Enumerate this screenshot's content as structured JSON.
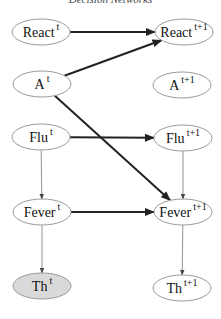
{
  "title": "Decision Networks",
  "colors": {
    "node_stroke": "#9a9a9a",
    "node_fill": "#ffffff",
    "observed_fill": "#d9d9d9",
    "thick_edge": "#222222",
    "thin_edge": "#777777"
  },
  "nodes": [
    {
      "id": "react_t",
      "base": "React",
      "sup": "t",
      "cx": 41,
      "cy": 32,
      "observed": false
    },
    {
      "id": "react_t1",
      "base": "React",
      "sup": "t+1",
      "cx": 184,
      "cy": 32,
      "observed": false
    },
    {
      "id": "a_t",
      "base": "A",
      "sup": "t",
      "cx": 42,
      "cy": 84,
      "observed": false
    },
    {
      "id": "a_t1",
      "base": "A",
      "sup": "t+1",
      "cx": 182,
      "cy": 85,
      "observed": false
    },
    {
      "id": "flu_t",
      "base": "Flu",
      "sup": "t",
      "cx": 41,
      "cy": 137,
      "observed": false
    },
    {
      "id": "flu_t1",
      "base": "Flu",
      "sup": "t+1",
      "cx": 183,
      "cy": 138,
      "observed": false
    },
    {
      "id": "fever_t",
      "base": "Fever",
      "sup": "t",
      "cx": 42,
      "cy": 212,
      "observed": false
    },
    {
      "id": "fever_t1",
      "base": "Fever",
      "sup": "t+1",
      "cx": 183,
      "cy": 212,
      "observed": false
    },
    {
      "id": "th_t",
      "base": "Th",
      "sup": "t",
      "cx": 42,
      "cy": 286,
      "observed": true
    },
    {
      "id": "th_t1",
      "base": "Th",
      "sup": "t+1",
      "cx": 182,
      "cy": 288,
      "observed": false
    }
  ],
  "edges": [
    {
      "from": "react_t",
      "to": "react_t1",
      "style": "thick"
    },
    {
      "from": "a_t",
      "to": "react_t1",
      "style": "thick"
    },
    {
      "from": "a_t",
      "to": "fever_t1",
      "style": "thick"
    },
    {
      "from": "flu_t",
      "to": "flu_t1",
      "style": "thick"
    },
    {
      "from": "fever_t",
      "to": "fever_t1",
      "style": "thick"
    },
    {
      "from": "flu_t",
      "to": "fever_t",
      "style": "thin"
    },
    {
      "from": "flu_t1",
      "to": "fever_t1",
      "style": "thin"
    },
    {
      "from": "fever_t",
      "to": "th_t",
      "style": "thin"
    },
    {
      "from": "fever_t1",
      "to": "th_t1",
      "style": "thin"
    }
  ]
}
